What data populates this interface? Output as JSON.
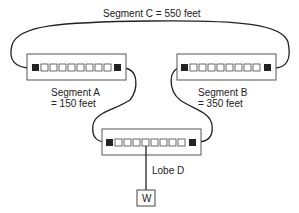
{
  "diagram": {
    "segment_c": {
      "label": "Segment C = 550 feet"
    },
    "segment_a": {
      "line1": "Segment A",
      "line2": "= 150 feet"
    },
    "segment_b": {
      "line1": "Segment B",
      "line2": "= 350 feet"
    },
    "lobe": {
      "label": "Lobe D"
    },
    "workstation": {
      "label": "W"
    },
    "units": [
      {
        "name": "mau-a",
        "ports": 10
      },
      {
        "name": "mau-b",
        "ports": 10
      },
      {
        "name": "mau-d",
        "ports": 10
      }
    ],
    "colors": {
      "line": "#222222",
      "box_border": "#555555",
      "port_fill": "#222222"
    }
  }
}
